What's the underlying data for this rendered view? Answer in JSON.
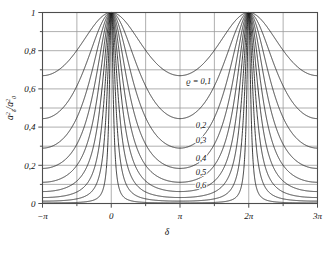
{
  "chart_data": {
    "type": "line",
    "title": "",
    "xlabel": "δ",
    "ylabel": "aδ²/a0²",
    "ylabel_parts": {
      "num_base": "a",
      "num_sup": "2",
      "num_sub": "δ",
      "den_base": "a",
      "den_sup": "2",
      "den_sub": "0"
    },
    "xlim": [
      -3.141592653589793,
      9.42477796076938
    ],
    "ylim": [
      0,
      1
    ],
    "grid": true,
    "grid_x_major_step_pi": 0.5,
    "grid_y_major_step": 0.1,
    "legend_position": "inline-annotations",
    "xticks": [
      {
        "value": -3.141592653589793,
        "label": "−π"
      },
      {
        "value": 0,
        "label": "0"
      },
      {
        "value": 3.141592653589793,
        "label": "π"
      },
      {
        "value": 6.283185307179586,
        "label": "2π"
      },
      {
        "value": 9.42477796076938,
        "label": "3π"
      }
    ],
    "yticks": [
      {
        "value": 0,
        "label": "0"
      },
      {
        "value": 0.2,
        "label": "0,2"
      },
      {
        "value": 0.4,
        "label": "0,4"
      },
      {
        "value": 0.6,
        "label": "0,6"
      },
      {
        "value": 0.8,
        "label": "0,8"
      },
      {
        "value": 1,
        "label": "1"
      }
    ],
    "yticks_minor": [
      0.1,
      0.3,
      0.5,
      0.7,
      0.9
    ],
    "formula": "(1-r)^2 / ((1-r)^2 + 4 r sin^2(delta/2))",
    "series": [
      {
        "name": "ϱ = 0,1",
        "rho": 0.1,
        "min_value": 0.669,
        "max_value": 1.0
      },
      {
        "name": "0,2",
        "rho": 0.2,
        "min_value": 0.444,
        "max_value": 1.0
      },
      {
        "name": "0,3",
        "rho": 0.3,
        "min_value": 0.29,
        "max_value": 1.0
      },
      {
        "name": "0,4",
        "rho": 0.4,
        "min_value": 0.184,
        "max_value": 1.0
      },
      {
        "name": "0,5",
        "rho": 0.5,
        "min_value": 0.111,
        "max_value": 1.0
      },
      {
        "name": "0,6",
        "rho": 0.6,
        "min_value": 0.063,
        "max_value": 1.0
      },
      {
        "name": "0,7",
        "rho": 0.7,
        "min_value": 0.031,
        "max_value": 1.0
      },
      {
        "name": "0,8",
        "rho": 0.8,
        "min_value": 0.012,
        "max_value": 1.0
      },
      {
        "name": "0,9",
        "rho": 0.9,
        "min_value": 0.003,
        "max_value": 1.0
      }
    ],
    "annotations": [
      {
        "text": "ϱ = 0,1",
        "x": 4.0,
        "y": 0.625
      },
      {
        "text": "0,2",
        "x": 4.1,
        "y": 0.395
      },
      {
        "text": "0,3",
        "x": 4.1,
        "y": 0.315
      },
      {
        "text": "0,4",
        "x": 4.1,
        "y": 0.225
      },
      {
        "text": "0,5",
        "x": 4.1,
        "y": 0.148
      },
      {
        "text": "0,6",
        "x": 4.1,
        "y": 0.082
      }
    ],
    "colors": {
      "curve": "#1a1a1a",
      "grid": "#9a9a9a",
      "frame": "#4d4d4d",
      "text": "#111111",
      "background": "#ffffff"
    }
  }
}
